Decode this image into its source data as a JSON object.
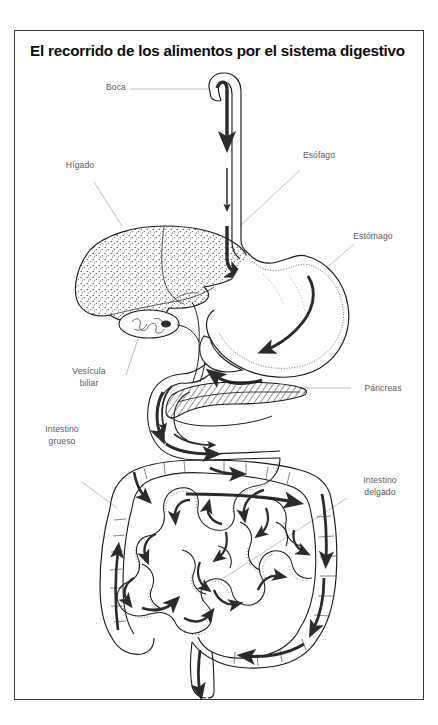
{
  "document": {
    "title": "El recorrido de los alimentos por el sistema digestivo",
    "language": "es",
    "background_color": "#ffffff",
    "frame_color": "#3a3a3a",
    "label_color": "#59595b",
    "ink_color": "#1a1a1a",
    "arrow_color": "#2b2b2b"
  },
  "labels": {
    "boca": "Boca",
    "higado": "Hígado",
    "vesicula": "Vesícula\nbiliar",
    "intestino_grueso": "Intestino\ngrueso",
    "esofago": "Esófago",
    "estomago": "Estómago",
    "pancreas": "Páncreas",
    "intestino_delgado": "Intestino\ndelgado"
  },
  "organs": [
    {
      "name": "boca",
      "label": "Boca"
    },
    {
      "name": "esofago",
      "label": "Esófago"
    },
    {
      "name": "estomago",
      "label": "Estómago"
    },
    {
      "name": "higado",
      "label": "Hígado"
    },
    {
      "name": "vesicula-biliar",
      "label": "Vesícula biliar"
    },
    {
      "name": "pancreas",
      "label": "Páncreas"
    },
    {
      "name": "intestino-delgado",
      "label": "Intestino delgado"
    },
    {
      "name": "intestino-grueso",
      "label": "Intestino grueso"
    }
  ]
}
